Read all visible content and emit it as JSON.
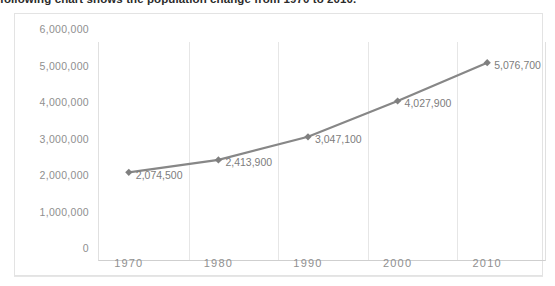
{
  "intro": {
    "text": "following chart shows the population change from 1970 to 2010."
  },
  "chart_data": {
    "type": "line",
    "title": "",
    "xlabel": "",
    "ylabel": "",
    "categories": [
      "1970",
      "1980",
      "1990",
      "2000",
      "2010"
    ],
    "values": [
      2074500,
      2413900,
      3047100,
      4027900,
      5076700
    ],
    "data_labels": [
      "2,074,500",
      "2,413,900",
      "3,047,100",
      "4,027,900",
      "5,076,700"
    ],
    "ylim": [
      0,
      6000000
    ],
    "ytick_labels": [
      "6,000,000",
      "5,000,000",
      "4,000,000",
      "3,000,000",
      "2,000,000",
      "1,000,000",
      "0"
    ],
    "ytick_values": [
      6000000,
      5000000,
      4000000,
      3000000,
      2000000,
      1000000,
      0
    ],
    "grid": "vertical",
    "legend": "none",
    "series_color": "#878787",
    "marker": "diamond",
    "marker_color": "#7f7f7f",
    "gridline_color": "#e6e6e6",
    "label_color": "#8f8f8f"
  }
}
